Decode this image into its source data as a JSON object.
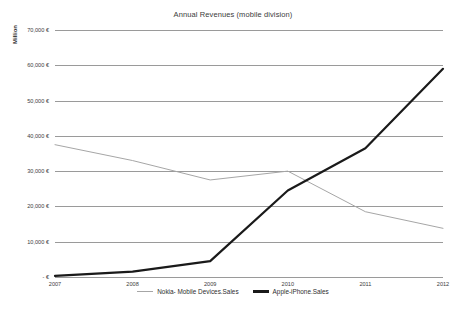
{
  "chart_data": {
    "type": "line",
    "title": "Annual Revenues (mobile division)",
    "xlabel": "",
    "ylabel": "Million",
    "categories": [
      "2007",
      "2008",
      "2009",
      "2010",
      "2011",
      "2012"
    ],
    "x": [
      2007,
      2008,
      2009,
      2010,
      2011,
      2012
    ],
    "ylim": [
      0,
      70000
    ],
    "ytick_values": [
      70000,
      60000,
      50000,
      40000,
      30000,
      20000,
      10000,
      0
    ],
    "ytick_labels": [
      "70,000 €",
      "60,000 €",
      "50,000 €",
      "40,000 €",
      "30,000 €",
      "20,000 €",
      "10,000 €",
      "-   €"
    ],
    "grid": true,
    "legend_position": "bottom",
    "series": [
      {
        "name": "Nokia- Mobile Devices.Sales",
        "color": "#a6a6a6",
        "width": 1.0,
        "values": [
          37500,
          33000,
          27500,
          30000,
          18500,
          13800
        ]
      },
      {
        "name": "Apple-iPhone.Sales",
        "color": "#1a1a1a",
        "width": 2.2,
        "values": [
          300,
          1500,
          4500,
          24500,
          36500,
          59000
        ]
      }
    ]
  },
  "caption": {
    "text": ""
  }
}
